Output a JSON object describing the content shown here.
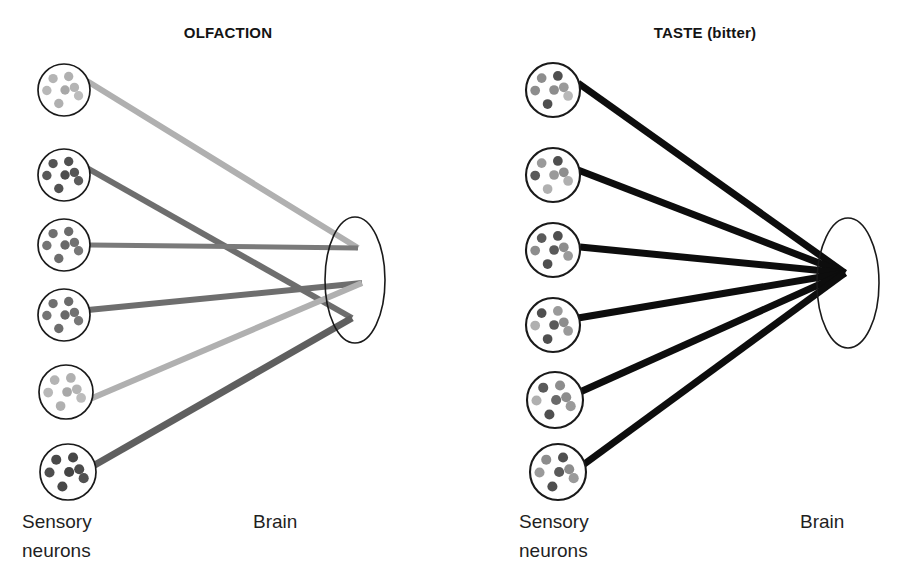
{
  "figure": {
    "background": "#ffffff",
    "width": 909,
    "height": 581
  },
  "panels": [
    {
      "id": "olfaction",
      "title": "OLFACTION",
      "title_x": 228,
      "title_y": 38,
      "labels": {
        "left_line1": "Sensory",
        "left_line2": "neurons",
        "right": "Brain",
        "left_x": 22,
        "left_y1": 528,
        "left_y2": 557,
        "right_x": 253,
        "right_y": 528
      },
      "brain": {
        "cx": 355,
        "cy": 280,
        "rx": 30,
        "ry": 63,
        "stroke": "#1a1a1a",
        "stroke_width": 1.6,
        "fill": "#ffffff"
      },
      "neurons": [
        {
          "id": "o1",
          "cx": 64,
          "cy": 90,
          "r": 26,
          "dot_color": "#b4b4b4",
          "exit_x": 87,
          "exit_y": 81
        },
        {
          "id": "o2",
          "cx": 64,
          "cy": 175,
          "r": 26,
          "dot_color": "#545454",
          "exit_x": 87,
          "exit_y": 168
        },
        {
          "id": "o3",
          "cx": 64,
          "cy": 245,
          "r": 26,
          "dot_color": "#6b6b6b",
          "exit_x": 90,
          "exit_y": 245
        },
        {
          "id": "o4",
          "cx": 64,
          "cy": 315,
          "r": 26,
          "dot_color": "#6b6b6b",
          "exit_x": 88,
          "exit_y": 310
        },
        {
          "id": "o5",
          "cx": 66,
          "cy": 392,
          "r": 27,
          "dot_color": "#b4b4b4",
          "exit_x": 90,
          "exit_y": 399
        },
        {
          "id": "o6",
          "cx": 68,
          "cy": 472,
          "r": 28,
          "dot_color": "#4a4a4a",
          "exit_x": 93,
          "exit_y": 466
        }
      ],
      "targets": {
        "upper": {
          "x": 358,
          "y": 248
        },
        "middle": {
          "x": 362,
          "y": 283
        },
        "lower": {
          "x": 352,
          "y": 318
        }
      },
      "connections": [
        {
          "from": "o1",
          "to": "upper",
          "color": "#b0b0b0",
          "width": 6
        },
        {
          "from": "o2",
          "to": "lower",
          "color": "#6e6e6e",
          "width": 6
        },
        {
          "from": "o3",
          "to": "upper",
          "color": "#7a7a7a",
          "width": 5
        },
        {
          "from": "o4",
          "to": "middle",
          "color": "#6e6e6e",
          "width": 6
        },
        {
          "from": "o5",
          "to": "middle",
          "color": "#b0b0b0",
          "width": 6
        },
        {
          "from": "o6",
          "to": "lower",
          "color": "#5f5f5f",
          "width": 7
        }
      ],
      "description": "Six olfactory sensory neurons project to three separate sites in the brain; connection lines cross, giving a combinatorial code."
    },
    {
      "id": "taste",
      "title": "TASTE (bitter)",
      "title_x": 705,
      "title_y": 38,
      "labels": {
        "left_line1": "Sensory",
        "left_line2": "neurons",
        "right": "Brain",
        "left_x": 519,
        "left_y1": 528,
        "left_y2": 557,
        "right_x": 800,
        "right_y": 528
      },
      "brain": {
        "cx": 848,
        "cy": 283,
        "rx": 31,
        "ry": 65,
        "stroke": "#1a1a1a",
        "stroke_width": 1.6,
        "fill": "#ffffff"
      },
      "neurons": [
        {
          "id": "t1",
          "cx": 553,
          "cy": 90,
          "r": 27,
          "dot_color": "mixed",
          "exit_x": 578,
          "exit_y": 83
        },
        {
          "id": "t2",
          "cx": 553,
          "cy": 175,
          "r": 27,
          "dot_color": "mixed",
          "exit_x": 578,
          "exit_y": 170
        },
        {
          "id": "t3",
          "cx": 553,
          "cy": 250,
          "r": 27,
          "dot_color": "mixed",
          "exit_x": 580,
          "exit_y": 247
        },
        {
          "id": "t4",
          "cx": 553,
          "cy": 325,
          "r": 27,
          "dot_color": "mixed",
          "exit_x": 578,
          "exit_y": 318
        },
        {
          "id": "t5",
          "cx": 555,
          "cy": 400,
          "r": 28,
          "dot_color": "mixed",
          "exit_x": 580,
          "exit_y": 392
        },
        {
          "id": "t6",
          "cx": 558,
          "cy": 472,
          "r": 28,
          "dot_color": "mixed",
          "exit_x": 583,
          "exit_y": 465
        }
      ],
      "targets": {
        "convergence": {
          "x": 845,
          "y": 273
        }
      },
      "connections": [
        {
          "from": "t1",
          "to": "convergence",
          "color": "#0d0d0d",
          "width": 7
        },
        {
          "from": "t2",
          "to": "convergence",
          "color": "#0d0d0d",
          "width": 7
        },
        {
          "from": "t3",
          "to": "convergence",
          "color": "#0d0d0d",
          "width": 7
        },
        {
          "from": "t4",
          "to": "convergence",
          "color": "#0d0d0d",
          "width": 7
        },
        {
          "from": "t5",
          "to": "convergence",
          "color": "#0d0d0d",
          "width": 7
        },
        {
          "from": "t6",
          "to": "convergence",
          "color": "#0d0d0d",
          "width": 7
        }
      ],
      "description": "Six bitter-taste sensory neurons all converge on a single point in the brain; labelled-line coding."
    }
  ],
  "dot_pattern": {
    "note": "Seven receptor dots arranged inside each sensory-neuron circle, radius scaled to circle",
    "offsets": [
      {
        "dx": -0.42,
        "dy": -0.44
      },
      {
        "dx": 0.18,
        "dy": -0.52
      },
      {
        "dx": -0.66,
        "dy": 0.02
      },
      {
        "dx": 0.04,
        "dy": 0.0
      },
      {
        "dx": 0.56,
        "dy": 0.22
      },
      {
        "dx": -0.2,
        "dy": 0.52
      },
      {
        "dx": 0.4,
        "dy": -0.1
      }
    ],
    "dot_radius_ratio": 0.18
  },
  "colors": {
    "light_gray_dot": "#b4b4b4",
    "mid_gray_dot": "#8d8d8d",
    "dark_gray_dot": "#4a4a4a",
    "outline": "#1a1a1a",
    "taste_line": "#0d0d0d",
    "text": "#1f1f1f"
  },
  "taste_dot_shades": [
    [
      "#8d8d8d",
      "#4f4f4f",
      "#8d8d8d",
      "#8d8d8d",
      "#b8b8b8",
      "#4f4f4f",
      "#9a9a9a"
    ],
    [
      "#9a9a9a",
      "#4f4f4f",
      "#5a5a5a",
      "#9a9a9a",
      "#b0b0b0",
      "#b0b0b0",
      "#8d8d8d"
    ],
    [
      "#5a5a5a",
      "#4f4f4f",
      "#8d8d8d",
      "#5a5a5a",
      "#9a9a9a",
      "#4f4f4f",
      "#8d8d8d"
    ],
    [
      "#4f4f4f",
      "#9a9a9a",
      "#b0b0b0",
      "#5a5a5a",
      "#9a9a9a",
      "#4f4f4f",
      "#8d8d8d"
    ],
    [
      "#5a5a5a",
      "#8d8d8d",
      "#b0b0b0",
      "#6a6a6a",
      "#9a9a9a",
      "#4f4f4f",
      "#8d8d8d"
    ],
    [
      "#8d8d8d",
      "#4f4f4f",
      "#9a9a9a",
      "#5a5a5a",
      "#9a9a9a",
      "#4f4f4f",
      "#8d8d8d"
    ]
  ],
  "olfaction_dot_shades": [
    [
      "#b4b4b4",
      "#b0b0b0",
      "#b8b8b8",
      "#a8a8a8",
      "#bcbcbc",
      "#b0b0b0",
      "#b4b4b4"
    ],
    [
      "#545454",
      "#505050",
      "#585858",
      "#4e4e4e",
      "#5c5c5c",
      "#525252",
      "#565656"
    ],
    [
      "#6f6f6f",
      "#6b6b6b",
      "#737373",
      "#696969",
      "#777777",
      "#6d6d6d",
      "#717171"
    ],
    [
      "#6f6f6f",
      "#6b6b6b",
      "#737373",
      "#696969",
      "#777777",
      "#6d6d6d",
      "#717171"
    ],
    [
      "#b4b4b4",
      "#b0b0b0",
      "#b8b8b8",
      "#a8a8a8",
      "#bcbcbc",
      "#b0b0b0",
      "#b4b4b4"
    ],
    [
      "#4a4a4a",
      "#464646",
      "#4e4e4e",
      "#444444",
      "#525252",
      "#484848",
      "#4c4c4c"
    ]
  ]
}
